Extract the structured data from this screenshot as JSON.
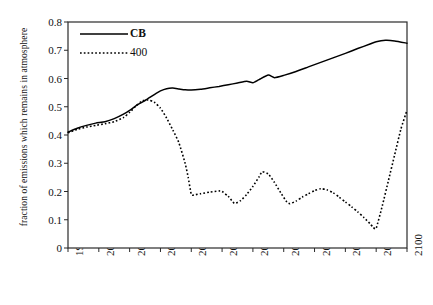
{
  "chart_data": {
    "type": "line",
    "title": "",
    "xlabel": "",
    "ylabel": "fraction of emissions which remains in atmosphere",
    "xlim": [
      1990,
      2100
    ],
    "ylim": [
      0,
      0.8
    ],
    "grid": false,
    "legend_position": "top-left-inside",
    "xticks": [
      "1990",
      "2000",
      "2010",
      "2020",
      "2030",
      "2040",
      "2050",
      "2060",
      "2070",
      "2080",
      "2090",
      "2100"
    ],
    "yticks": [
      "0",
      "0.1",
      "0.2",
      "0.3",
      "0.4",
      "0.5",
      "0.6",
      "0.7",
      "0.8"
    ],
    "series": [
      {
        "name": "CB",
        "style": "solid",
        "color": "#000000",
        "x": [
          1990,
          1993,
          1996,
          1999,
          2002,
          2005,
          2008,
          2010,
          2012,
          2015,
          2018,
          2020,
          2022,
          2024,
          2026,
          2028,
          2030,
          2033,
          2036,
          2039,
          2042,
          2045,
          2048,
          2050,
          2052,
          2055,
          2057,
          2060,
          2064,
          2068,
          2072,
          2076,
          2080,
          2084,
          2088,
          2090,
          2093,
          2096,
          2100
        ],
        "y": [
          0.41,
          0.424,
          0.434,
          0.442,
          0.447,
          0.458,
          0.474,
          0.487,
          0.503,
          0.522,
          0.543,
          0.556,
          0.564,
          0.566,
          0.563,
          0.56,
          0.559,
          0.562,
          0.567,
          0.572,
          0.578,
          0.584,
          0.59,
          0.585,
          0.596,
          0.612,
          0.603,
          0.611,
          0.625,
          0.641,
          0.657,
          0.673,
          0.689,
          0.706,
          0.722,
          0.73,
          0.735,
          0.733,
          0.725
        ]
      },
      {
        "name": "400",
        "style": "dotted",
        "color": "#000000",
        "x": [
          1990,
          1993,
          1996,
          1999,
          2002,
          2005,
          2008,
          2010,
          2012,
          2014,
          2016,
          2018,
          2020,
          2022,
          2024,
          2026,
          2028,
          2029,
          2030,
          2031,
          2033,
          2036,
          2039,
          2040,
          2042,
          2044,
          2046,
          2048,
          2050,
          2052,
          2053,
          2055,
          2057,
          2059,
          2061,
          2062,
          2064,
          2066,
          2068,
          2070,
          2072,
          2074,
          2076,
          2078,
          2080,
          2082,
          2084,
          2086,
          2088,
          2089,
          2090,
          2092,
          2094,
          2096,
          2098,
          2100
        ],
        "y": [
          0.408,
          0.42,
          0.428,
          0.434,
          0.44,
          0.447,
          0.462,
          0.48,
          0.502,
          0.52,
          0.524,
          0.516,
          0.495,
          0.46,
          0.418,
          0.372,
          0.3,
          0.25,
          0.19,
          0.188,
          0.192,
          0.198,
          0.202,
          0.2,
          0.183,
          0.158,
          0.168,
          0.19,
          0.218,
          0.252,
          0.27,
          0.262,
          0.232,
          0.196,
          0.163,
          0.157,
          0.166,
          0.18,
          0.192,
          0.203,
          0.21,
          0.206,
          0.196,
          0.18,
          0.163,
          0.146,
          0.128,
          0.108,
          0.086,
          0.074,
          0.07,
          0.15,
          0.24,
          0.33,
          0.42,
          0.488
        ]
      }
    ]
  },
  "legend": {
    "items": [
      {
        "label": "CB",
        "style": "solid"
      },
      {
        "label": "400",
        "style": "dotted"
      }
    ]
  }
}
